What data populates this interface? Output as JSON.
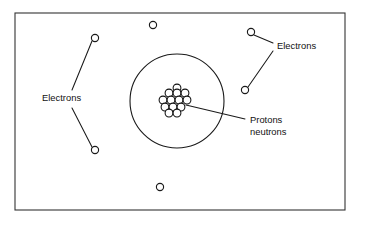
{
  "diagram": {
    "background_color": "#ffffff",
    "line_color": "#1a1a1a",
    "frame": {
      "x": 15,
      "y": 13,
      "width": 330,
      "height": 197
    },
    "shell": {
      "cx": 177,
      "cy": 101,
      "r": 47
    },
    "labels": {
      "electrons_left": "Electrons",
      "electrons_right": "Electrons",
      "protons": "Protons",
      "neutrons": "neutrons"
    },
    "label_positions": {
      "electrons_left": {
        "x": 42,
        "y": 99
      },
      "electrons_right": {
        "x": 277,
        "y": 47
      },
      "protons": {
        "x": 250,
        "y": 121
      },
      "neutrons": {
        "x": 250,
        "y": 133
      }
    },
    "electrons": [
      {
        "name": "electron-top",
        "cx": 153,
        "cy": 25,
        "r": 3.6
      },
      {
        "name": "electron-upper-left",
        "cx": 95,
        "cy": 38,
        "r": 3.6
      },
      {
        "name": "electron-lower-left",
        "cx": 95,
        "cy": 150,
        "r": 3.6
      },
      {
        "name": "electron-upper-right",
        "cx": 251,
        "cy": 32,
        "r": 3.6
      },
      {
        "name": "electron-lower-right",
        "cx": 245,
        "cy": 90,
        "r": 3.6
      },
      {
        "name": "electron-bottom",
        "cx": 160,
        "cy": 187,
        "r": 3.6
      }
    ],
    "leader_lines": [
      {
        "name": "leader-electrons-left-upper",
        "x1": 72,
        "y1": 90,
        "x2": 92,
        "y2": 41
      },
      {
        "name": "leader-electrons-left-lower",
        "x1": 72,
        "y1": 108,
        "x2": 92,
        "y2": 147
      },
      {
        "name": "leader-electrons-right-upper",
        "x1": 273,
        "y1": 43,
        "x2": 254,
        "y2": 35
      },
      {
        "name": "leader-electrons-right-lower",
        "x1": 273,
        "y1": 51,
        "x2": 248,
        "y2": 87
      },
      {
        "name": "leader-nucleus",
        "x1": 245,
        "y1": 119,
        "x2": 186,
        "y2": 105
      }
    ],
    "nucleus": {
      "name": "nucleus-cluster",
      "nucleon_radius": 3.9,
      "nucleons": [
        {
          "cx": 177,
          "cy": 88
        },
        {
          "cx": 169,
          "cy": 93
        },
        {
          "cx": 177,
          "cy": 93
        },
        {
          "cx": 185,
          "cy": 93
        },
        {
          "cx": 163,
          "cy": 100
        },
        {
          "cx": 171,
          "cy": 100
        },
        {
          "cx": 179,
          "cy": 100
        },
        {
          "cx": 187,
          "cy": 100
        },
        {
          "cx": 165,
          "cy": 107
        },
        {
          "cx": 173,
          "cy": 107
        },
        {
          "cx": 181,
          "cy": 107
        },
        {
          "cx": 169,
          "cy": 113
        },
        {
          "cx": 177,
          "cy": 113
        }
      ]
    }
  }
}
